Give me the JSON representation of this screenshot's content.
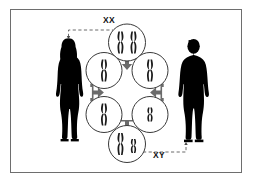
{
  "figure": {
    "background_color": "#ffffff",
    "frame_color": "#6e6e6e",
    "silhouette_color": "#000000",
    "connector_color": "#6b6b6b",
    "chromosome_color": "#1a1a1a",
    "circle_stroke_color": "#3a3a3a",
    "dashed_line_color": "#6b6b6b"
  },
  "labels": {
    "female_genotype": "XX",
    "male_genotype": "XY"
  },
  "parents": [
    {
      "id": "female-parent",
      "name": "female-silhouette",
      "side": "left",
      "genotype": "XX",
      "hair": "long"
    },
    {
      "id": "male-parent",
      "name": "male-silhouette",
      "side": "right",
      "genotype": "XY",
      "hair": "short"
    }
  ],
  "cells": [
    {
      "id": "cell-top",
      "position": "top",
      "genotype": "XX",
      "chromosomes": [
        {
          "type": "X",
          "length": "long"
        },
        {
          "type": "X",
          "length": "long"
        }
      ]
    },
    {
      "id": "cell-upper-left",
      "position": "upper-left",
      "genotype": "X",
      "chromosomes": [
        {
          "type": "X",
          "length": "long"
        }
      ]
    },
    {
      "id": "cell-upper-right",
      "position": "upper-right",
      "genotype": "X",
      "chromosomes": [
        {
          "type": "X",
          "length": "long"
        }
      ]
    },
    {
      "id": "cell-lower-left",
      "position": "lower-left",
      "genotype": "X",
      "chromosomes": [
        {
          "type": "X",
          "length": "long"
        }
      ]
    },
    {
      "id": "cell-lower-right",
      "position": "lower-right",
      "genotype": "Y",
      "chromosomes": [
        {
          "type": "Y",
          "length": "short"
        }
      ]
    },
    {
      "id": "cell-bottom",
      "position": "bottom",
      "genotype": "XY",
      "chromosomes": [
        {
          "type": "X",
          "length": "long"
        },
        {
          "type": "Y",
          "length": "short"
        }
      ]
    }
  ],
  "connectors": [
    {
      "id": "connector-top",
      "name": "split-arrow-top",
      "direction": "down-split"
    },
    {
      "id": "connector-left",
      "name": "split-arrow-left",
      "direction": "right-split"
    },
    {
      "id": "connector-right",
      "name": "split-arrow-right",
      "direction": "left-split"
    },
    {
      "id": "connector-bottom",
      "name": "merge-arrow-bottom",
      "direction": "down-merge"
    }
  ],
  "leaders": [
    {
      "id": "leader-female",
      "from": "female-silhouette-head",
      "to": "XX"
    },
    {
      "id": "leader-male",
      "from": "XY",
      "to": "male-silhouette-feet"
    }
  ]
}
